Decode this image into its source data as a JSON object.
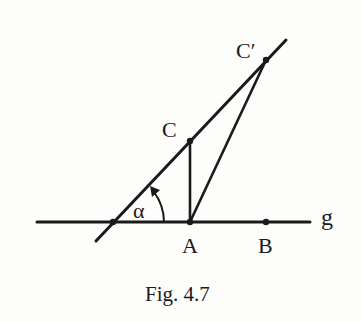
{
  "figure": {
    "caption": "Fig. 4.7",
    "line_color": "#1a1a1a",
    "background": "#fdfdfb"
  },
  "labels": {
    "c_prime": "C′",
    "c": "C",
    "alpha": "α",
    "a": "A",
    "b": "B",
    "g": "g"
  },
  "points": {
    "intersection": [
      113,
      222
    ],
    "A": [
      190,
      222
    ],
    "B": [
      266,
      222
    ],
    "C": [
      190,
      141
    ],
    "C_prime": [
      266,
      60
    ]
  }
}
